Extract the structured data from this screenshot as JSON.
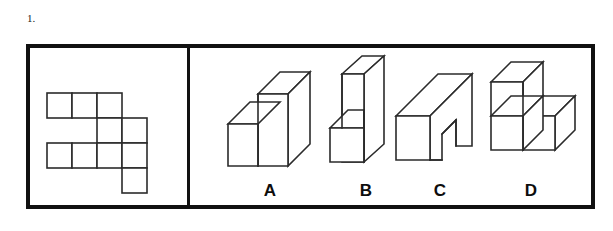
{
  "question": {
    "number": "1.",
    "type": "spatial-visualization-multiple-choice"
  },
  "net_panel": {
    "name": "flat-pattern-net",
    "description": "Unfolded flat pattern of polyomino squares",
    "cell_size": 25,
    "origin": {
      "x": 17,
      "y": 45
    },
    "cells": [
      {
        "col": 0,
        "row": 0
      },
      {
        "col": 1,
        "row": 0
      },
      {
        "col": 2,
        "row": 0
      },
      {
        "col": 2,
        "row": 1
      },
      {
        "col": 3,
        "row": 1
      },
      {
        "col": 0,
        "row": 2
      },
      {
        "col": 1,
        "row": 2
      },
      {
        "col": 2,
        "row": 2
      },
      {
        "col": 3,
        "row": 2
      },
      {
        "col": 3,
        "row": 3
      }
    ]
  },
  "options": [
    {
      "id": "a",
      "label": "A",
      "shape": "l-shaped-step-block",
      "description": "Tall block with a low step ledge on the left front"
    },
    {
      "id": "b",
      "label": "B",
      "shape": "tall-slab-with-front-cube",
      "description": "Tall thin vertical slab with a cube attached at bottom front"
    },
    {
      "id": "c",
      "label": "C",
      "shape": "notched-block",
      "description": "Rectangular block with a notch cut from the lower right"
    },
    {
      "id": "d",
      "label": "D",
      "shape": "three-cube-l-arrangement",
      "description": "Three cubes: one stacked on top left, two side by side below"
    }
  ],
  "colors": {
    "frame": "#111111",
    "line": "#2b2b2b",
    "background": "#ffffff",
    "label_text": "#0d0d0d"
  }
}
